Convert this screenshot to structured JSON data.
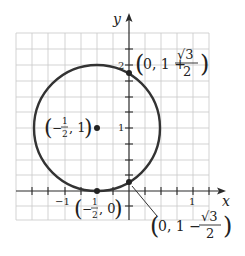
{
  "diagram": {
    "type": "circle-on-coordinate-plane",
    "axes": {
      "x_label": "x",
      "y_label": "y"
    },
    "tick_labels": {
      "x": [
        "−1",
        "1"
      ],
      "y": [
        "1",
        "2"
      ]
    },
    "grid": {
      "spacing_units": 0.25,
      "x_range": [
        -1.75,
        1.25
      ],
      "y_range": [
        -0.5,
        2.5
      ]
    },
    "circle": {
      "center": [
        -0.5,
        1
      ],
      "radius": 1,
      "color": "#333333"
    },
    "points": [
      {
        "name": "center",
        "coords": [
          -0.5,
          1
        ],
        "label_open": "(",
        "label_a": "−",
        "label_num": "1",
        "label_den": "2",
        "label_rest": ", 1",
        "label_close": ")"
      },
      {
        "name": "tangent",
        "coords": [
          -0.5,
          0
        ],
        "label_open": "(",
        "label_a": "−",
        "label_num": "1",
        "label_den": "2",
        "label_rest": ", 0",
        "label_close": ")"
      },
      {
        "name": "upper-intercept",
        "coords": [
          0,
          1.866
        ],
        "label_open": "(",
        "label_pre": "0, 1 + ",
        "label_num": "√3",
        "label_den": "2",
        "label_close": ")"
      },
      {
        "name": "lower-intercept",
        "coords": [
          0,
          0.134
        ],
        "label_open": "(",
        "label_pre": "0, 1 − ",
        "label_num": "√3",
        "label_den": "2",
        "label_close": ")"
      }
    ]
  }
}
